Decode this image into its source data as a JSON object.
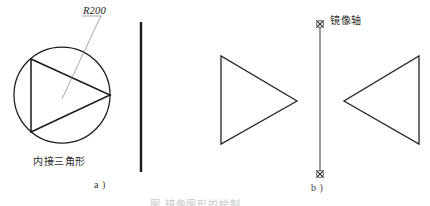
{
  "figure": {
    "background_color": "#ffffff",
    "line_color": "#1a1a1a",
    "leader_color": "#8a8a8a",
    "width": 430,
    "height": 206
  },
  "panel_a": {
    "sub_label": "a )",
    "radius_label": "R200",
    "shape_caption": "内接三角形",
    "circle": {
      "cx": 62,
      "cy": 95,
      "r": 48
    },
    "triangle_points": "31,59 31,132 110,95"
  },
  "divider": {
    "x": 141,
    "y_top": 22,
    "y_bottom": 172
  },
  "panel_b": {
    "sub_label": "b )",
    "axis_label": "镜像轴",
    "axis": {
      "x": 320,
      "y_top": 28,
      "y_bottom": 170
    },
    "left_triangle_points": "221,56 221,144 297,101",
    "right_triangle_points": "419,56 419,144 344,101"
  },
  "bottom_caption": {
    "text": "图    镜像图形的绘制"
  }
}
